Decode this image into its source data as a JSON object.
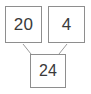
{
  "diagram": {
    "type": "number-bond",
    "colors": {
      "background": "#ffffff",
      "box_border": "#8e8e8e",
      "box_fill": "#ffffff",
      "text": "#3a3a3a",
      "connector": "#9a9a9a"
    },
    "parts": [
      {
        "id": "addend-left",
        "value": "20"
      },
      {
        "id": "addend-right",
        "value": "4"
      }
    ],
    "whole": {
      "id": "sum",
      "value": "24"
    },
    "connectors": [
      {
        "id": "connector-left",
        "from": "addend-left",
        "to": "sum"
      },
      {
        "id": "connector-right",
        "from": "addend-right",
        "to": "sum"
      }
    ]
  }
}
